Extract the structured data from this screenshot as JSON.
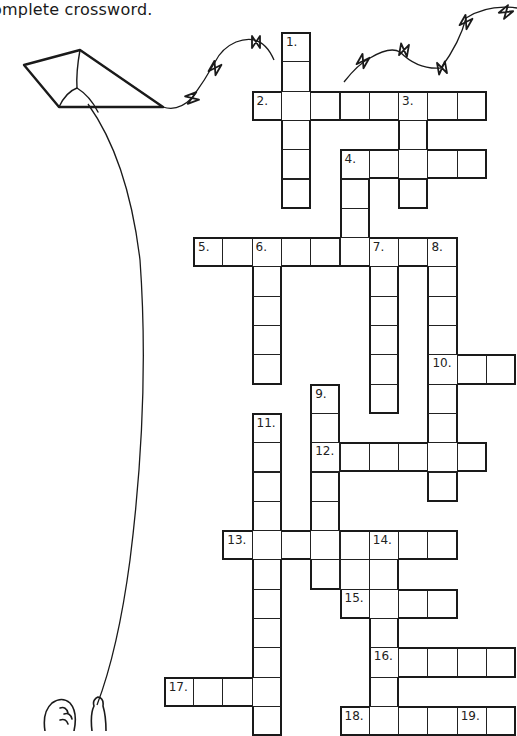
{
  "instruction": "omplete crossword.",
  "crossword": {
    "entries": [
      {
        "number": "1.",
        "direction": "down",
        "row": 0,
        "col": 3,
        "length": 6
      },
      {
        "number": "2.",
        "direction": "across",
        "row": 2,
        "col": 2,
        "length": 8
      },
      {
        "number": "3.",
        "direction": "down",
        "row": 2,
        "col": 7,
        "length": 4
      },
      {
        "number": "4.",
        "direction": "across",
        "row": 4,
        "col": 5,
        "length": 5
      },
      {
        "number": "4.",
        "direction": "down",
        "row": 4,
        "col": 5,
        "length": 4
      },
      {
        "number": "5.",
        "direction": "across",
        "row": 7,
        "col": 0,
        "length": 9
      },
      {
        "number": "6.",
        "direction": "down",
        "row": 7,
        "col": 2,
        "length": 5
      },
      {
        "number": "7.",
        "direction": "down",
        "row": 7,
        "col": 6,
        "length": 6
      },
      {
        "number": "8.",
        "direction": "down",
        "row": 7,
        "col": 8,
        "length": 9
      },
      {
        "number": "10.",
        "direction": "across",
        "row": 11,
        "col": 8,
        "length": 3
      },
      {
        "number": "9.",
        "direction": "down",
        "row": 12,
        "col": 4,
        "length": 7
      },
      {
        "number": "11.",
        "direction": "down",
        "row": 13,
        "col": 2,
        "length": 11
      },
      {
        "number": "12.",
        "direction": "across",
        "row": 14,
        "col": 4,
        "length": 6
      },
      {
        "number": "13.",
        "direction": "across",
        "row": 17,
        "col": 1,
        "length": 8
      },
      {
        "number": "14.",
        "direction": "down",
        "row": 17,
        "col": 6,
        "length": 7
      },
      {
        "number": "15.",
        "direction": "across",
        "row": 19,
        "col": 5,
        "length": 4
      },
      {
        "number": "16.",
        "direction": "across",
        "row": 21,
        "col": 6,
        "length": 5
      },
      {
        "number": "17.",
        "direction": "across",
        "row": 22,
        "col": -1,
        "length": 4
      },
      {
        "number": "18.",
        "direction": "across",
        "row": 23,
        "col": 5,
        "length": 6
      },
      {
        "number": "19.",
        "direction": "down",
        "row": 23,
        "col": 9,
        "length": 1
      }
    ],
    "extra_cells": [
      {
        "row": 18,
        "col": 5
      }
    ]
  },
  "illustration": {
    "subject": "kite-with-string-and-child",
    "icons": [
      "kite-icon",
      "kite-tail-bow-icon",
      "child-icon"
    ]
  }
}
